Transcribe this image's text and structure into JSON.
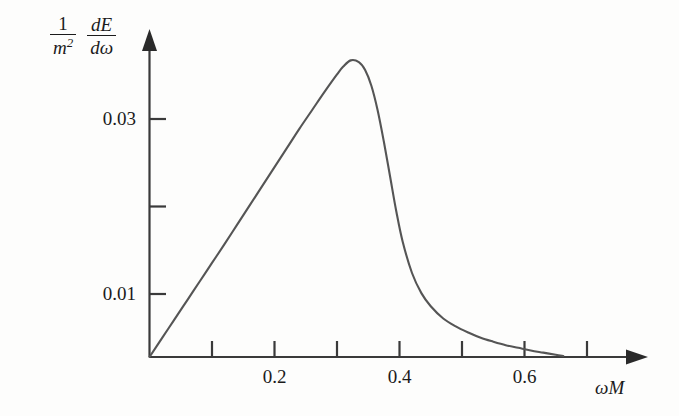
{
  "figure": {
    "background_color": "#fdfdfc",
    "axis_color": "#3a3a3a",
    "curve_color": "#555555",
    "text_color": "#1b1b1b",
    "ylabel": {
      "numerator_1": "1",
      "denominator_1": "m",
      "denominator_1_exponent": "2",
      "numerator_2": "dE",
      "denominator_2": "dω"
    },
    "xlabel": "ωM"
  },
  "chart_data": {
    "type": "line",
    "title": "",
    "xlabel": "ωM",
    "ylabel": "(1/m²) dE/dω",
    "xlim": [
      0,
      0.72
    ],
    "ylim": [
      0,
      0.0395
    ],
    "grid": false,
    "legend": null,
    "xticks": [
      0.1,
      0.2,
      0.3,
      0.4,
      0.5,
      0.6,
      0.7
    ],
    "xtick_labels": [
      "",
      "0.2",
      "",
      "0.4",
      "",
      "0.6",
      ""
    ],
    "yticks": [
      0.01,
      0.02,
      0.03
    ],
    "ytick_labels": [
      "0.01",
      "",
      "0.03"
    ],
    "series": [
      {
        "name": "dE/dω",
        "x": [
          0.0,
          0.02,
          0.04,
          0.06,
          0.08,
          0.1,
          0.12,
          0.14,
          0.16,
          0.18,
          0.2,
          0.22,
          0.24,
          0.26,
          0.28,
          0.3,
          0.31,
          0.322,
          0.335,
          0.345,
          0.355,
          0.365,
          0.375,
          0.385,
          0.395,
          0.405,
          0.42,
          0.435,
          0.45,
          0.47,
          0.49,
          0.51,
          0.53,
          0.55,
          0.57,
          0.59,
          0.61,
          0.63,
          0.65,
          0.662
        ],
        "y": [
          0.0028,
          0.00495,
          0.0071,
          0.00925,
          0.0114,
          0.01355,
          0.0157,
          0.0179,
          0.0201,
          0.0223,
          0.0245,
          0.0267,
          0.0289,
          0.031,
          0.0331,
          0.0351,
          0.036,
          0.0367,
          0.0365,
          0.0356,
          0.0338,
          0.031,
          0.0274,
          0.0234,
          0.0194,
          0.016,
          0.0124,
          0.0101,
          0.0086,
          0.0072,
          0.0063,
          0.0056,
          0.005,
          0.00455,
          0.00415,
          0.00385,
          0.00355,
          0.0033,
          0.00305,
          0.00292
        ]
      }
    ]
  }
}
